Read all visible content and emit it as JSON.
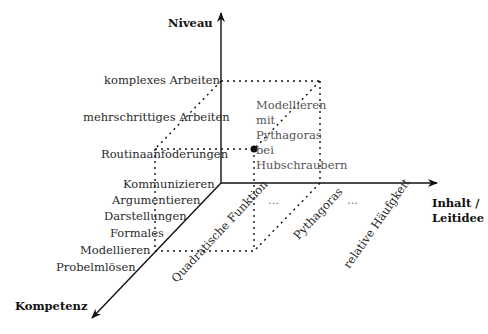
{
  "axes": {
    "vertical": {
      "label": "Niveau"
    },
    "horizontal": {
      "label_line1": "Inhalt /",
      "label_line2": "Leitidee"
    },
    "depth": {
      "label": "Kompetenz"
    }
  },
  "niveau_levels": [
    "komplexes Arbeiten",
    "mehrschrittiges Arbeiten",
    "Routinaanfoderungen"
  ],
  "kompetenzen": [
    "Kommunizieren",
    "Argumentieren",
    "Darstellungen",
    "Formales",
    "Modellieren",
    "Probelmlösen"
  ],
  "inhalte": [
    "Quadratische Funktion",
    "...",
    "Pythagoras",
    "...",
    "relative Häufgkeit"
  ],
  "example_task": {
    "text": "Modellieren mit Pythagoras bei Hubschraubern"
  },
  "colors": {
    "axis": "#111111",
    "dots": "#111111",
    "text": "#2a2a2a",
    "note": "#555555"
  }
}
